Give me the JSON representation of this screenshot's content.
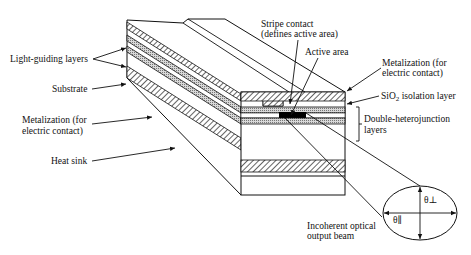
{
  "diagram": {
    "type": "semiconductor laser diode cross-section (stripe geometry, double heterostructure)",
    "labels_left": {
      "light_guiding": "Light-guiding layers",
      "substrate": "Substrate",
      "metal_bottom_1": "Metalization (for",
      "metal_bottom_2": "electric contact)",
      "heat_sink": "Heat sink"
    },
    "labels_top": {
      "stripe_1": "Stripe contact",
      "stripe_2": "(defines active area)",
      "active": "Active area"
    },
    "labels_right": {
      "metal_top_1": "Metalization (for",
      "metal_top_2": "electric contact)",
      "sio2_prefix": "SiO",
      "sio2_sub": "2",
      "sio2_suffix": " isolation layer",
      "dh_1": "Double-heterojunction",
      "dh_2": "layers"
    },
    "beam": {
      "label_1": "Incoherent optical",
      "label_2": "output beam",
      "theta_perp": "θ⊥",
      "theta_par": "θ∥"
    },
    "colors": {
      "line": "#111111",
      "background": "#ffffff",
      "active": "#000000",
      "guide_fill": "#bdbdbd"
    }
  }
}
